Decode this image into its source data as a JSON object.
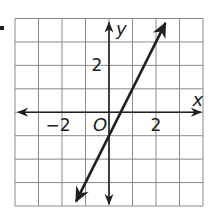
{
  "bullet": "•",
  "chart_data": {
    "type": "line",
    "title": "",
    "xlabel": "x",
    "ylabel": "y",
    "origin_label": "O",
    "xlim": [
      -4,
      4
    ],
    "ylim": [
      -4,
      4
    ],
    "grid": true,
    "grid_step": 1,
    "x_tick_labels": [
      {
        "value": -2,
        "label": "−2"
      },
      {
        "value": 2,
        "label": "2"
      }
    ],
    "y_tick_labels": [
      {
        "value": 2,
        "label": "2"
      }
    ],
    "series": [
      {
        "name": "line",
        "equation": "y = 2x - 1",
        "slope": 2,
        "intercept": -1,
        "x": [
          -1.4,
          2.4
        ],
        "y": [
          -3.8,
          3.8
        ],
        "arrows": "both"
      }
    ]
  },
  "colors": {
    "grid": "#8a8a8a",
    "axis": "#231f20",
    "line": "#231f20",
    "background": "#ffffff"
  }
}
